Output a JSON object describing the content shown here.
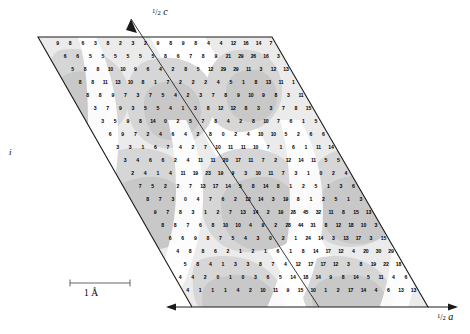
{
  "figure": {
    "type": "crystallographic-electron-density-map",
    "title_visible": false,
    "background": "#ffffff",
    "axes": {
      "c_axis": {
        "label_prefix": "1",
        "label_denom": "2",
        "label_symbol": "c",
        "position": "top-center",
        "arrow": "up-left"
      },
      "a_axis": {
        "label_prefix": "1",
        "label_denom": "2",
        "label_symbol": "a",
        "position": "bottom-right",
        "arrow": "right"
      },
      "b_axis": {
        "label_symbol": "i",
        "position": "left-middle"
      }
    },
    "scalebar": {
      "value": "1",
      "unit": "Å",
      "caption": "1 Å",
      "x_start": 70,
      "x_end": 130
    },
    "cell": {
      "top_left": [
        38,
        37
      ],
      "top_right": [
        272,
        37
      ],
      "bottom_right": [
        428,
        307
      ],
      "bottom_left": [
        192,
        307
      ]
    },
    "diagonal": {
      "from": [
        131,
        19
      ],
      "to": [
        319,
        307
      ]
    },
    "colors": {
      "outline": "#1a1a1a",
      "shade_light": "#ebebeb",
      "shade_mid": "#d6d6d6",
      "shade_dark": "#c4c4c4",
      "white": "#ffffff",
      "number": "#000000"
    }
  },
  "chart_data": {
    "type": "heatmap",
    "title": "",
    "xlabel": "1/2 a",
    "ylabel": "1/2 c",
    "grid": true,
    "legend": "none",
    "row_step_y": 13.0,
    "col_step_x": 12.55,
    "row_shift_x": 7.5,
    "origin": [
      45,
      44
    ],
    "rows": [
      {
        "n": 20,
        "values": [
          9,
          9,
          8,
          6,
          3,
          8,
          2,
          3,
          2,
          9,
          8,
          9,
          8,
          4,
          4,
          12,
          16,
          14,
          7,
          8
        ]
      },
      {
        "n": 21,
        "values": [
          9,
          6,
          6,
          5,
          5,
          5,
          5,
          5,
          5,
          8,
          6,
          7,
          8,
          9,
          21,
          29,
          26,
          16,
          3,
          7,
          11
        ]
      },
      {
        "n": 22,
        "values": [
          5,
          5,
          8,
          8,
          10,
          10,
          9,
          6,
          4,
          2,
          8,
          5,
          12,
          29,
          29,
          11,
          3,
          12,
          13,
          4,
          2,
          1
        ]
      },
      {
        "n": 23,
        "values": [
          8,
          8,
          8,
          11,
          13,
          10,
          8,
          1,
          7,
          2,
          2,
          2,
          4,
          5,
          1,
          8,
          13,
          11,
          1,
          7,
          12,
          10,
          3
        ]
      },
      {
        "n": 24,
        "values": [
          9,
          8,
          8,
          9,
          7,
          3,
          7,
          5,
          4,
          2,
          3,
          7,
          8,
          9,
          10,
          9,
          8,
          3,
          11,
          12,
          18,
          16,
          2,
          1
        ]
      },
      {
        "n": 24,
        "values": [
          2,
          3,
          7,
          9,
          3,
          5,
          5,
          4,
          1,
          3,
          8,
          12,
          12,
          8,
          3,
          3,
          7,
          8,
          15,
          12,
          4,
          3,
          6,
          7
        ]
      },
      {
        "n": 25,
        "values": [
          8,
          3,
          5,
          9,
          8,
          14,
          0,
          2,
          5,
          7,
          8,
          4,
          2,
          8,
          10,
          7,
          6,
          1,
          5,
          9,
          9,
          5,
          2,
          8,
          11
        ]
      },
      {
        "n": 25,
        "values": [
          1,
          6,
          9,
          7,
          2,
          4,
          6,
          4,
          2,
          8,
          0,
          2,
          4,
          10,
          10,
          5,
          2,
          6,
          6,
          12,
          13,
          9,
          4,
          1,
          5
        ]
      },
      {
        "n": 26,
        "values": [
          0,
          3,
          3,
          1,
          6,
          7,
          4,
          2,
          7,
          10,
          11,
          11,
          10,
          7,
          1,
          6,
          1,
          11,
          14,
          12,
          7,
          2,
          1,
          8,
          1,
          5
        ]
      },
      {
        "n": 26,
        "values": [
          4,
          3,
          4,
          6,
          6,
          2,
          4,
          11,
          11,
          20,
          17,
          11,
          7,
          2,
          12,
          14,
          11,
          5,
          5,
          1,
          1,
          3,
          2,
          9,
          2,
          1
        ]
      },
      {
        "n": 27,
        "values": [
          7,
          2,
          4,
          1,
          4,
          11,
          19,
          23,
          19,
          9,
          3,
          10,
          11,
          7,
          3,
          1,
          0,
          2,
          4,
          6,
          6,
          9,
          1,
          0,
          2,
          4,
          6
        ]
      },
      {
        "n": 27,
        "values": [
          9,
          7,
          5,
          2,
          2,
          7,
          13,
          17,
          14,
          5,
          8,
          14,
          8,
          1,
          2,
          5,
          1,
          3,
          6,
          8,
          8,
          8,
          3,
          1,
          2,
          5,
          2
        ]
      },
      {
        "n": 28,
        "values": [
          9,
          8,
          7,
          3,
          0,
          4,
          7,
          6,
          2,
          12,
          14,
          3,
          19,
          8,
          1,
          2,
          5,
          1,
          3,
          6,
          8,
          8,
          6,
          22,
          27,
          19,
          6,
          5
        ]
      },
      {
        "n": 28,
        "values": [
          9,
          9,
          7,
          8,
          3,
          1,
          2,
          7,
          13,
          14,
          2,
          19,
          28,
          45,
          32,
          11,
          8,
          15,
          13,
          6,
          7,
          1,
          4,
          7,
          8,
          11,
          10,
          7
        ]
      },
      {
        "n": 29,
        "values": [
          9,
          8,
          8,
          7,
          6,
          8,
          10,
          10,
          4,
          9,
          2,
          28,
          44,
          31,
          8,
          12,
          18,
          10,
          3,
          12,
          12,
          5,
          4,
          8,
          11,
          24,
          14,
          3,
          13
        ]
      },
      {
        "n": 29,
        "values": [
          9,
          6,
          6,
          9,
          8,
          7,
          5,
          4,
          3,
          0,
          2,
          1,
          24,
          14,
          3,
          13,
          17,
          3,
          15,
          26,
          25,
          15,
          3,
          6,
          8,
          1,
          8,
          14,
          17
        ]
      },
      {
        "n": 30,
        "values": [
          1,
          4,
          8,
          8,
          6,
          2,
          1,
          2,
          1,
          6,
          1,
          8,
          14,
          17,
          12,
          4,
          20,
          30,
          29,
          16,
          3,
          7,
          9,
          2,
          12,
          17,
          17,
          12,
          3,
          8
        ]
      },
      {
        "n": 30,
        "values": [
          2,
          5,
          8,
          4,
          1,
          3,
          3,
          8,
          7,
          4,
          12,
          17,
          17,
          12,
          3,
          8,
          19,
          22,
          18,
          7,
          4,
          10,
          8,
          5,
          1,
          14,
          18,
          14,
          9,
          8
        ]
      },
      {
        "n": 31,
        "values": [
          4,
          4,
          2,
          0,
          1,
          0,
          3,
          6,
          5,
          14,
          18,
          14,
          9,
          8,
          14,
          5,
          11,
          4,
          6,
          11,
          11,
          7,
          1,
          3,
          2,
          9,
          15,
          10,
          1,
          2,
          17
        ]
      },
      {
        "n": 31,
        "values": [
          4,
          1,
          1,
          1,
          4,
          2,
          10,
          11,
          9,
          15,
          10,
          1,
          2,
          17,
          14,
          4,
          6,
          13,
          13,
          9,
          2,
          4,
          5,
          4,
          7,
          9,
          8,
          2,
          7,
          15,
          17
        ]
      },
      {
        "n": 32,
        "values": [
          3,
          1,
          2,
          7,
          10,
          10,
          8,
          9,
          8,
          2,
          7,
          15,
          17,
          10,
          1,
          11,
          16,
          13,
          5,
          3,
          6,
          7,
          2,
          4,
          8,
          2,
          11,
          13,
          18,
          12,
          2,
          9
        ]
      },
      {
        "n": 32,
        "values": [
          4,
          4,
          1,
          9,
          5,
          2,
          1,
          2,
          11,
          13,
          18,
          12,
          2,
          9,
          16,
          17,
          12,
          4,
          4,
          6,
          6,
          9,
          7,
          3,
          24,
          27,
          20,
          6,
          9,
          8,
          14,
          8
        ]
      },
      {
        "n": 33,
        "values": [
          8,
          9,
          6,
          4,
          5,
          18,
          3,
          24,
          27,
          20,
          6,
          9,
          8,
          14,
          8,
          1,
          2,
          4,
          3,
          8,
          11,
          10,
          7,
          1,
          26,
          29,
          13,
          1,
          16,
          16,
          2,
          16,
          26
        ]
      },
      {
        "n": 33,
        "values": [
          10,
          9,
          6,
          2,
          12,
          1,
          26,
          29,
          13,
          1,
          16,
          16,
          2,
          16,
          26,
          22,
          10,
          1,
          7,
          8,
          9,
          10,
          10,
          9,
          8,
          20,
          20,
          5,
          8,
          10,
          9,
          11,
          46
        ]
      },
      {
        "n": 34,
        "values": [
          9,
          7,
          9,
          2,
          2,
          7,
          13,
          17,
          14,
          5,
          8,
          11,
          5,
          5,
          2,
          14,
          17,
          3,
          28,
          40,
          24,
          60,
          27,
          3,
          17,
          34,
          2,
          6,
          8,
          2,
          4,
          8,
          19,
          10
        ]
      }
    ]
  }
}
